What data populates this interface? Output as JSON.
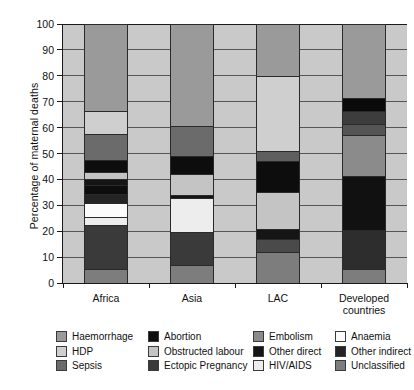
{
  "chart_data": {
    "type": "bar",
    "variant": "stacked-bar-100-percent",
    "title": "",
    "xlabel": "",
    "ylabel": "Percentage of maternal deaths",
    "ylim": [
      0,
      100
    ],
    "yticks": [
      0,
      10,
      20,
      30,
      40,
      50,
      60,
      70,
      80,
      90,
      100
    ],
    "grid": true,
    "grid_axis": "y",
    "legend_position": "bottom",
    "categories": [
      "Africa",
      "Asia",
      "LAC",
      "Developed countries"
    ],
    "series": [
      {
        "name": "Haemorrhage",
        "color": "#9a9a9a",
        "values": [
          33.5,
          39.5,
          20.0,
          28.5
        ]
      },
      {
        "name": "HDP",
        "color": "#cfcfcf",
        "values": [
          9.0,
          0.0,
          29.0,
          0.0
        ]
      },
      {
        "name": "Sepsis",
        "color": "#6b6b6b",
        "values": [
          10.0,
          11.5,
          0.0,
          5.0
        ]
      },
      {
        "name": "Abortion",
        "color": "#0d0d0d",
        "values": [
          4.5,
          7.0,
          12.0,
          5.0
        ]
      },
      {
        "name": "Obstructed labour",
        "color": "#c4c4c4",
        "values": [
          3.0,
          8.0,
          14.0,
          0.0
        ]
      },
      {
        "name": "Ectopic Pregnancy",
        "color": "#3a3a3a",
        "values": [
          17.0,
          12.5,
          0.0,
          15.0
        ]
      },
      {
        "name": "Embolism",
        "color": "#8b8b8b",
        "values": [
          0.0,
          0.0,
          4.0,
          15.5
        ]
      },
      {
        "name": "Other direct",
        "color": "#151515",
        "values": [
          2.0,
          1.0,
          4.0,
          4.5
        ]
      },
      {
        "name": "HIV/AIDS",
        "color": "#ededed",
        "values": [
          3.0,
          13.5,
          0.0,
          0.0
        ]
      },
      {
        "name": "Anaemia",
        "color": "#fbfbfb",
        "values": [
          5.5,
          0.0,
          0.0,
          0.0
        ]
      },
      {
        "name": "Other indirect",
        "color": "#242424",
        "values": [
          3.5,
          0.0,
          5.0,
          21.0
        ]
      },
      {
        "name": "Unclassified",
        "color": "#7d7d7d",
        "values": [
          5.5,
          7.0,
          12.0,
          5.5
        ]
      }
    ],
    "stacks": [
      {
        "category": "Africa",
        "segments": [
          {
            "name": "Unclassified",
            "from": 0.0,
            "to": 5.5,
            "color": "#7d7d7d"
          },
          {
            "name": "Ectopic Pregnancy",
            "from": 5.5,
            "to": 22.5,
            "color": "#3a3a3a"
          },
          {
            "name": "HIV/AIDS",
            "from": 22.5,
            "to": 25.5,
            "color": "#ededed"
          },
          {
            "name": "Anaemia",
            "from": 25.5,
            "to": 31.0,
            "color": "#fbfbfb"
          },
          {
            "name": "Other indirect",
            "from": 31.0,
            "to": 34.5,
            "color": "#242424"
          },
          {
            "name": "Abortion",
            "from": 34.5,
            "to": 38.0,
            "color": "#0d0d0d"
          },
          {
            "name": "Other direct",
            "from": 38.0,
            "to": 40.0,
            "color": "#151515"
          },
          {
            "name": "Obstructed labour",
            "from": 40.0,
            "to": 43.0,
            "color": "#c4c4c4"
          },
          {
            "name": "Abortion",
            "from": 43.0,
            "to": 47.5,
            "color": "#0d0d0d"
          },
          {
            "name": "Sepsis",
            "from": 47.5,
            "to": 57.5,
            "color": "#6b6b6b"
          },
          {
            "name": "HDP",
            "from": 57.5,
            "to": 66.5,
            "color": "#cfcfcf"
          },
          {
            "name": "Haemorrhage",
            "from": 66.5,
            "to": 100.0,
            "color": "#9a9a9a"
          }
        ]
      },
      {
        "category": "Asia",
        "segments": [
          {
            "name": "Unclassified",
            "from": 0.0,
            "to": 7.0,
            "color": "#7d7d7d"
          },
          {
            "name": "Ectopic Pregnancy",
            "from": 7.0,
            "to": 19.5,
            "color": "#3a3a3a"
          },
          {
            "name": "HIV/AIDS",
            "from": 19.5,
            "to": 33.0,
            "color": "#ededed"
          },
          {
            "name": "Other direct",
            "from": 33.0,
            "to": 34.0,
            "color": "#151515"
          },
          {
            "name": "Obstructed labour",
            "from": 34.0,
            "to": 42.0,
            "color": "#c4c4c4"
          },
          {
            "name": "Abortion",
            "from": 42.0,
            "to": 49.0,
            "color": "#0d0d0d"
          },
          {
            "name": "Sepsis",
            "from": 49.0,
            "to": 60.5,
            "color": "#6b6b6b"
          },
          {
            "name": "Haemorrhage",
            "from": 60.5,
            "to": 100.0,
            "color": "#9a9a9a"
          }
        ]
      },
      {
        "category": "LAC",
        "segments": [
          {
            "name": "Unclassified",
            "from": 0.0,
            "to": 12.0,
            "color": "#7d7d7d"
          },
          {
            "name": "Other indirect",
            "from": 12.0,
            "to": 17.0,
            "color": "#4a4a4a"
          },
          {
            "name": "Other direct",
            "from": 17.0,
            "to": 21.0,
            "color": "#151515"
          },
          {
            "name": "Obstructed labour",
            "from": 21.0,
            "to": 35.0,
            "color": "#c4c4c4"
          },
          {
            "name": "Abortion",
            "from": 35.0,
            "to": 47.0,
            "color": "#0d0d0d"
          },
          {
            "name": "Embolism",
            "from": 47.0,
            "to": 51.0,
            "color": "#5f5f5f"
          },
          {
            "name": "HDP",
            "from": 51.0,
            "to": 80.0,
            "color": "#cfcfcf"
          },
          {
            "name": "Haemorrhage",
            "from": 80.0,
            "to": 100.0,
            "color": "#9a9a9a"
          }
        ]
      },
      {
        "category": "Developed countries",
        "segments": [
          {
            "name": "Unclassified",
            "from": 0.0,
            "to": 5.5,
            "color": "#7d7d7d"
          },
          {
            "name": "Ectopic Pregnancy",
            "from": 5.5,
            "to": 20.5,
            "color": "#2d2d2d"
          },
          {
            "name": "Other indirect",
            "from": 20.5,
            "to": 41.5,
            "color": "#111111"
          },
          {
            "name": "Embolism",
            "from": 41.5,
            "to": 57.0,
            "color": "#8b8b8b"
          },
          {
            "name": "Other direct",
            "from": 57.0,
            "to": 61.5,
            "color": "#555555"
          },
          {
            "name": "Sepsis",
            "from": 61.5,
            "to": 66.5,
            "color": "#3d3d3d"
          },
          {
            "name": "Abortion",
            "from": 66.5,
            "to": 71.5,
            "color": "#0a0a0a"
          },
          {
            "name": "Haemorrhage",
            "from": 71.5,
            "to": 100.0,
            "color": "#9a9a9a"
          }
        ]
      }
    ]
  },
  "legend": {
    "rows": [
      [
        {
          "label": "Haemorrhage",
          "color": "#9a9a9a"
        },
        {
          "label": "Abortion",
          "color": "#0d0d0d"
        },
        {
          "label": "Embolism",
          "color": "#8b8b8b"
        },
        {
          "label": "Anaemia",
          "color": "#fbfbfb"
        }
      ],
      [
        {
          "label": "HDP",
          "color": "#cfcfcf"
        },
        {
          "label": "Obstructed labour",
          "color": "#c4c4c4"
        },
        {
          "label": "Other direct",
          "color": "#151515"
        },
        {
          "label": "Other indirect",
          "color": "#242424"
        }
      ],
      [
        {
          "label": "Sepsis",
          "color": "#6b6b6b"
        },
        {
          "label": "Ectopic Pregnancy",
          "color": "#3a3a3a"
        },
        {
          "label": "HIV/AIDS",
          "color": "#ededed"
        },
        {
          "label": "Unclassified",
          "color": "#7d7d7d"
        }
      ]
    ]
  },
  "axis": {
    "plot_background": "#c9c9c9",
    "axis_color": "#1a1a1a",
    "gridline_color": "#555555"
  }
}
